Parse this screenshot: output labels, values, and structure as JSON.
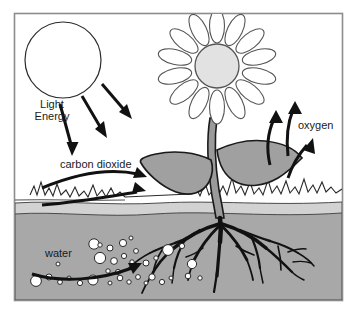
{
  "diagram": {
    "frame": {
      "x": 14,
      "y": 13,
      "width": 329,
      "height": 288,
      "border_color": "#8c8c8c",
      "background": "#ffffff"
    },
    "labels": {
      "light_energy_line1": "Light",
      "light_energy_line2": "Energy",
      "carbon_dioxide": "carbon dioxide",
      "oxygen": "oxygen",
      "water": "water"
    },
    "colors": {
      "outline": "#1a1a1a",
      "soil": "#a8a8a8",
      "subsoil_band": "#c9c9c9",
      "leaf_fill": "#a0a0a0",
      "stem_fill": "#9a9a9a",
      "flower_center": "#e2e2e2",
      "petal_fill": "#ffffff",
      "sun_fill": "#ffffff",
      "droplet_fill": "#ffffff",
      "frame_border": "#8c8c8c",
      "page_background": "#ffffff"
    },
    "elements": {
      "sun": {
        "name": "sun",
        "cx": 63,
        "cy": 60,
        "r": 38
      },
      "light_arrows_count": 3,
      "co2_arrows_count": 2,
      "oxygen_arrows_count": 3,
      "water_arrows_count": 1,
      "flower_petals_count": 14,
      "leaves_count": 2,
      "water_droplets_count": 34,
      "ground_level_y": 202,
      "soil_top_y": 213
    }
  }
}
